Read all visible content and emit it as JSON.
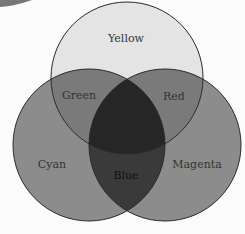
{
  "diagram": {
    "type": "venn",
    "sets": [
      {
        "name": "Yellow",
        "cx": 127,
        "cy": 78,
        "r": 76
      },
      {
        "name": "Cyan",
        "cx": 89,
        "cy": 145,
        "r": 76
      },
      {
        "name": "Magenta",
        "cx": 165,
        "cy": 145,
        "r": 76
      }
    ],
    "labels": {
      "yellow": "Yellow",
      "green": "Green",
      "red": "Red",
      "cyan": "Cyan",
      "magenta": "Magenta",
      "blue": "Blue"
    },
    "colors": {
      "background": "#fbfbfb",
      "yellow_only": "#e4e4e4",
      "single": "#8c8c8c",
      "pair_top": "#7a7a7a",
      "pair_bottom": "#3a3a3a",
      "center": "#262626",
      "stroke": "#2a2a2a"
    }
  }
}
